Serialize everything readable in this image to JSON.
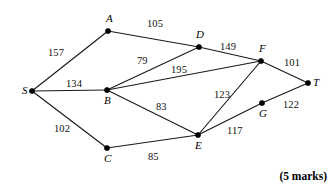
{
  "figure": {
    "marks_note": "(5 marks)",
    "colors": {
      "edge": "#1a1a1a",
      "node": "#000000",
      "background": "#ffffff",
      "text": "#000000"
    }
  },
  "graph_data": {
    "type": "network-diagram",
    "title": "",
    "nodes": [
      {
        "id": "S",
        "label": "S",
        "x": 32,
        "y": 91,
        "label_dx": -10,
        "label_dy": -6
      },
      {
        "id": "A",
        "label": "A",
        "x": 108,
        "y": 31,
        "label_dx": -2,
        "label_dy": -18
      },
      {
        "id": "B",
        "label": "B",
        "x": 107,
        "y": 90,
        "label_dx": -3,
        "label_dy": 5
      },
      {
        "id": "C",
        "label": "C",
        "x": 107,
        "y": 148,
        "label_dx": -3,
        "label_dy": 5
      },
      {
        "id": "D",
        "label": "D",
        "x": 199,
        "y": 47,
        "label_dx": -3,
        "label_dy": -18
      },
      {
        "id": "E",
        "label": "E",
        "x": 198,
        "y": 135,
        "label_dx": -3,
        "label_dy": 5
      },
      {
        "id": "F",
        "label": "F",
        "x": 261,
        "y": 61,
        "label_dx": -2,
        "label_dy": -18
      },
      {
        "id": "G",
        "label": "G",
        "x": 262,
        "y": 103,
        "label_dx": -3,
        "label_dy": 5
      },
      {
        "id": "T",
        "label": "T",
        "x": 308,
        "y": 83,
        "label_dx": 5,
        "label_dy": -6
      }
    ],
    "edges": [
      {
        "from": "S",
        "to": "A",
        "weight": 157,
        "label": "157",
        "label_x": 48,
        "label_y": 48
      },
      {
        "from": "A",
        "to": "D",
        "weight": 105,
        "label": "105",
        "label_x": 147,
        "label_y": 19
      },
      {
        "from": "S",
        "to": "B",
        "weight": 134,
        "label": "134",
        "label_x": 66,
        "label_y": 79
      },
      {
        "from": "B",
        "to": "D",
        "weight": 79,
        "label": "79",
        "label_x": 137,
        "label_y": 56
      },
      {
        "from": "B",
        "to": "F",
        "weight": 195,
        "label": "195",
        "label_x": 171,
        "label_y": 65
      },
      {
        "from": "D",
        "to": "F",
        "weight": 149,
        "label": "149",
        "label_x": 220,
        "label_y": 42
      },
      {
        "from": "F",
        "to": "T",
        "weight": 101,
        "label": "101",
        "label_x": 284,
        "label_y": 58
      },
      {
        "from": "B",
        "to": "E",
        "weight": 83,
        "label": "83",
        "label_x": 156,
        "label_y": 102
      },
      {
        "from": "E",
        "to": "F",
        "weight": 123,
        "label": "123",
        "label_x": 214,
        "label_y": 90
      },
      {
        "from": "S",
        "to": "C",
        "weight": 102,
        "label": "102",
        "label_x": 54,
        "label_y": 124
      },
      {
        "from": "C",
        "to": "E",
        "weight": 85,
        "label": "85",
        "label_x": 148,
        "label_y": 152
      },
      {
        "from": "E",
        "to": "G",
        "weight": 117,
        "label": "117",
        "label_x": 227,
        "label_y": 126
      },
      {
        "from": "G",
        "to": "T",
        "weight": 122,
        "label": "122",
        "label_x": 283,
        "label_y": 100
      }
    ]
  }
}
